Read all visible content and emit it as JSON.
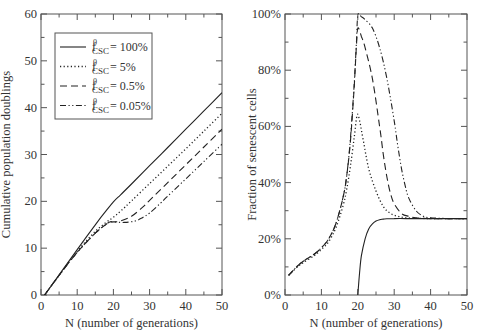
{
  "chart_data": [
    {
      "type": "line",
      "title": "",
      "xlabel": "N (number of generations)",
      "ylabel": "Cumulative population doublings",
      "xlim": [
        0,
        50
      ],
      "ylim": [
        0,
        60
      ],
      "xticks": [
        0,
        10,
        20,
        30,
        40,
        50
      ],
      "yticks": [
        0,
        10,
        20,
        30,
        40,
        50,
        60
      ],
      "grid": false,
      "legend_position": "upper-left",
      "series": [
        {
          "name": "f0_CSC = 100%",
          "legend_label": "= 100%",
          "style": "solid",
          "x": [
            1,
            5,
            10,
            15,
            18,
            20,
            22,
            25,
            30,
            35,
            40,
            45,
            50
          ],
          "y": [
            0,
            4.3,
            9.7,
            15,
            18,
            19.9,
            21.4,
            23.7,
            27.6,
            31.5,
            35.4,
            39.3,
            43.2
          ]
        },
        {
          "name": "f0_CSC = 5%",
          "legend_label": "= 5%",
          "style": "dotted",
          "x": [
            1,
            5,
            10,
            15,
            18,
            20,
            22,
            25,
            30,
            35,
            40,
            45,
            50
          ],
          "y": [
            0,
            4.2,
            9.3,
            13.6,
            15.5,
            16.6,
            17.9,
            20.1,
            23.8,
            27.5,
            31.2,
            35,
            38.8
          ]
        },
        {
          "name": "f0_CSC = 0.5%",
          "legend_label": "= 0.5%",
          "style": "dashed",
          "x": [
            1,
            5,
            10,
            15,
            18,
            19,
            20,
            22,
            25,
            28,
            30,
            35,
            40,
            45,
            50
          ],
          "y": [
            0,
            4.2,
            9.1,
            13.2,
            15.1,
            15.6,
            15.6,
            15.8,
            16.8,
            18.7,
            20.2,
            24,
            27.8,
            31.6,
            35.4
          ]
        },
        {
          "name": "f0_CSC = 0.05%",
          "legend_label": "= 0.05%",
          "style": "dash-dot-dot",
          "x": [
            1,
            5,
            10,
            15,
            18,
            19,
            20,
            23,
            26,
            28,
            30,
            33,
            35,
            40,
            45,
            50
          ],
          "y": [
            0,
            4.2,
            9.1,
            13.2,
            15.1,
            15.6,
            15.6,
            15.5,
            15.8,
            16.5,
            17.5,
            19.6,
            21.1,
            24.8,
            28.5,
            32.2
          ]
        }
      ],
      "legend_symbol": "f",
      "legend_superscript": "0",
      "legend_subscript": "CSC"
    },
    {
      "type": "line",
      "title": "",
      "xlabel": "N (number of generations)",
      "ylabel": "Fraction of senescent cells",
      "xlim": [
        0,
        50
      ],
      "ylim": [
        0,
        100
      ],
      "xticks": [
        0,
        10,
        20,
        30,
        40,
        50
      ],
      "yticks": [
        0,
        20,
        40,
        60,
        80,
        100
      ],
      "ytick_labels": [
        "0%",
        "20%",
        "40%",
        "60%",
        "80%",
        "100%"
      ],
      "grid": false,
      "series": [
        {
          "name": "f0_CSC = 100%",
          "style": "solid",
          "x": [
            20,
            20.5,
            21,
            22,
            23,
            24,
            25,
            26,
            27,
            28,
            30,
            35,
            40,
            45,
            50
          ],
          "y": [
            0,
            8,
            14,
            20,
            23.5,
            25.3,
            26.3,
            26.8,
            27,
            27.1,
            27.2,
            27.2,
            27.2,
            27.2,
            27.2
          ]
        },
        {
          "name": "f0_CSC = 5%",
          "style": "dotted",
          "x": [
            1,
            3,
            5,
            8,
            10,
            12,
            14,
            16,
            17,
            18,
            19,
            19.8,
            20.5,
            21.5,
            23,
            25,
            27,
            29,
            31,
            33,
            36,
            40,
            45,
            50
          ],
          "y": [
            7,
            9.5,
            11.5,
            14,
            16.2,
            19,
            24,
            32,
            38,
            46,
            56,
            64,
            62,
            55,
            45,
            37,
            31.5,
            29,
            28,
            27.5,
            27.3,
            27.2,
            27.2,
            27.2
          ]
        },
        {
          "name": "f0_CSC = 0.5%",
          "style": "dashed",
          "x": [
            1,
            3,
            5,
            8,
            10,
            12,
            14,
            16,
            17,
            18,
            19,
            19.6,
            20,
            21,
            22,
            24,
            26,
            27,
            28,
            29,
            30,
            32,
            34,
            36,
            40,
            45,
            50
          ],
          "y": [
            7,
            9.8,
            12,
            14.5,
            16.8,
            20,
            25.5,
            35,
            43,
            55,
            74,
            88,
            95,
            92,
            88,
            77,
            60,
            50,
            42,
            36,
            32.5,
            29,
            28,
            27.5,
            27.2,
            27.2,
            27.2
          ]
        },
        {
          "name": "f0_CSC = 0.05%",
          "style": "dash-dot-dot",
          "x": [
            1,
            3,
            5,
            8,
            10,
            12,
            14,
            16,
            17,
            18,
            19,
            19.6,
            20,
            21,
            22,
            24,
            26,
            28,
            30,
            31,
            32,
            33,
            34,
            36,
            38,
            40,
            45,
            50
          ],
          "y": [
            7,
            9.8,
            12,
            14.5,
            16.8,
            20,
            25.5,
            35,
            43,
            56,
            75,
            89,
            99.5,
            99,
            98,
            95,
            88,
            77,
            62,
            53,
            45,
            39,
            34.5,
            30,
            28,
            27.5,
            27.2,
            27.2
          ]
        }
      ]
    }
  ]
}
